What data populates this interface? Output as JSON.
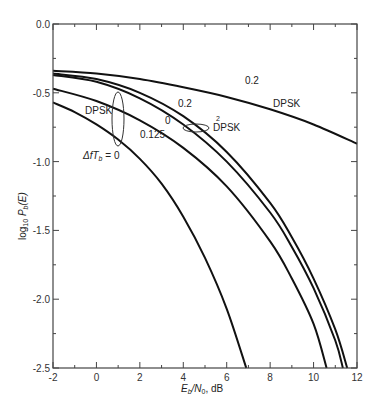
{
  "chart_data": {
    "type": "line",
    "title": "",
    "xlabel": "E_b/N_0, dB",
    "ylabel": "log10 P_b(E)",
    "xlim": [
      -2,
      12
    ],
    "ylim": [
      -2.5,
      0.0
    ],
    "grid": false,
    "x_ticks": [
      -2,
      0,
      2,
      4,
      6,
      8,
      10,
      12
    ],
    "x_tick_labels": [
      "-2",
      "0",
      "2",
      "4",
      "6",
      "8",
      "10",
      "12"
    ],
    "y_ticks": [
      0.0,
      -0.5,
      -1.0,
      -1.5,
      -2.0,
      -2.5
    ],
    "y_tick_labels": [
      "0.0",
      "-0.5",
      "-1.0",
      "-1.5",
      "-2.0",
      "-2.5"
    ],
    "series": [
      {
        "name": "DPSK, ΔfT_b = 0.2",
        "x": [
          -2,
          0,
          2,
          4,
          6,
          8,
          10,
          12
        ],
        "y": [
          -0.34,
          -0.36,
          -0.4,
          -0.46,
          -0.53,
          -0.62,
          -0.73,
          -0.87
        ]
      },
      {
        "name": "2DPSK, ΔfT_b = 0.2",
        "x": [
          -2,
          0,
          2,
          4,
          6,
          8,
          9,
          10,
          11,
          11.55
        ],
        "y": [
          -0.36,
          -0.4,
          -0.5,
          -0.67,
          -0.93,
          -1.3,
          -1.55,
          -1.85,
          -2.22,
          -2.5
        ]
      },
      {
        "name": "2DPSK, ΔfT_b = 0",
        "x": [
          -2,
          0,
          2,
          4,
          6,
          8,
          9,
          10,
          11,
          11.35
        ],
        "y": [
          -0.37,
          -0.42,
          -0.54,
          -0.73,
          -1.0,
          -1.37,
          -1.62,
          -1.92,
          -2.3,
          -2.5
        ]
      },
      {
        "name": "2DPSK, ΔfT_b = 0.125",
        "x": [
          -2,
          0,
          2,
          4,
          6,
          8,
          9,
          10,
          10.6
        ],
        "y": [
          -0.47,
          -0.56,
          -0.7,
          -0.9,
          -1.18,
          -1.58,
          -1.85,
          -2.18,
          -2.5
        ]
      },
      {
        "name": "DPSK, ΔfT_b = 0",
        "x": [
          -2,
          -1,
          0,
          1,
          2,
          3,
          4,
          5,
          6,
          6.9
        ],
        "y": [
          -0.57,
          -0.64,
          -0.73,
          -0.84,
          -0.98,
          -1.16,
          -1.4,
          -1.7,
          -2.07,
          -2.5
        ]
      }
    ],
    "annotations": [
      {
        "text": "0.2",
        "x": 4.8,
        "y": -0.37
      },
      {
        "text": "DPSK",
        "x": 9.2,
        "y": -0.57
      },
      {
        "text": "0.2",
        "x": 3.9,
        "y": -0.57
      },
      {
        "text": "0",
        "x": 3.5,
        "y": -0.72
      },
      {
        "text": "DPSK",
        "x": 5.6,
        "y": -0.74
      },
      {
        "text": "2",
        "x": 5.7,
        "y": -0.69
      },
      {
        "text": "0.125",
        "x": 1.8,
        "y": -0.82
      },
      {
        "text": "DPSK",
        "x": -0.6,
        "y": -0.63
      },
      {
        "text": "ΔfT_b = 0",
        "x": -0.2,
        "y": -0.95
      }
    ]
  },
  "labels": {
    "xlabel_main": "E",
    "xlabel_sub1": "b",
    "xlabel_mid": "/N",
    "xlabel_sub2": "0",
    "xlabel_tail": ", dB",
    "ylabel_pre": "log",
    "ylabel_sub1": "10",
    "ylabel_P": " P",
    "ylabel_sub2": "b",
    "ylabel_tail": "(E)",
    "anno_top_02": "0.2",
    "anno_top_dpsk": "DPSK",
    "anno_mid_02": "0.2",
    "anno_0": "0",
    "anno_2dpsk": "DPSK",
    "anno_2dpsk_sup": "2",
    "anno_0125": "0.125",
    "anno_left_dpsk": "DPSK",
    "anno_df_pre": "Δ",
    "anno_df_f": "fT",
    "anno_df_sub": "b",
    "anno_df_tail": " = 0"
  }
}
